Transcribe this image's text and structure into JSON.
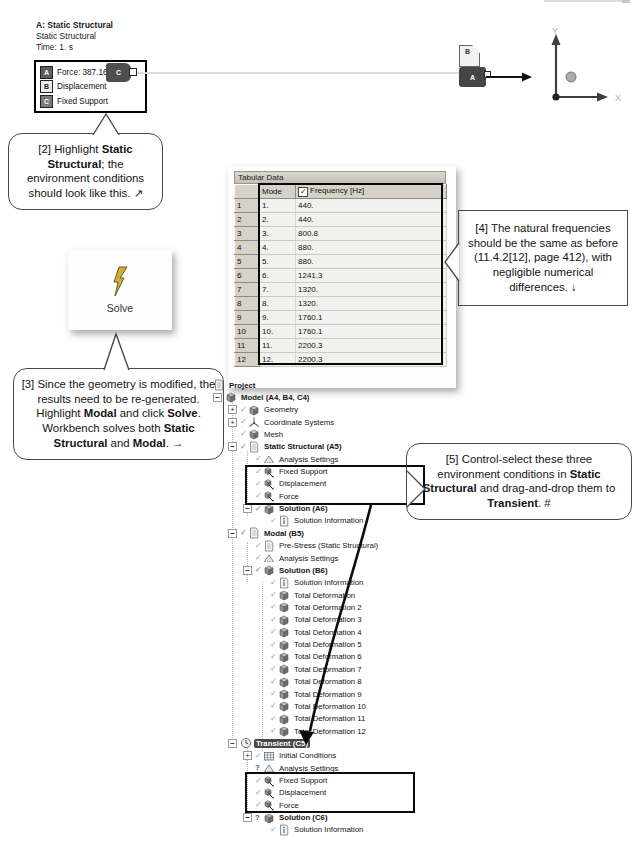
{
  "annotation_legend": {
    "title": "A: Static Structural",
    "line2": "Static Structural",
    "line3": "Time: 1. s",
    "items": [
      {
        "tag": "A",
        "label": "Force: 387.16 N",
        "chip_color": "#5c5c5c",
        "chip_text_color": "#ffffff"
      },
      {
        "tag": "B",
        "label": "Displacement",
        "chip_color": "#ececec",
        "chip_text_color": "#222222"
      },
      {
        "tag": "C",
        "label": "Fixed Support",
        "chip_color": "#7a7a7a",
        "chip_text_color": "#ffffff"
      }
    ]
  },
  "model_view": {
    "tags": {
      "left_support": "C",
      "top_right": "B",
      "bottom_right": "A"
    },
    "triad": {
      "x_label": "X",
      "y_label": "Y"
    }
  },
  "callouts": {
    "c2": {
      "segments": [
        [
          "n",
          "[2] Highlight "
        ],
        [
          "b",
          "Static Structural"
        ],
        [
          "n",
          "; the environment conditions should look like this. ↗"
        ]
      ]
    },
    "c3": {
      "segments": [
        [
          "n",
          "[3] Since the geometry is modified, the results need to be re-generated.  Highlight "
        ],
        [
          "b",
          "Modal"
        ],
        [
          "n",
          " and click "
        ],
        [
          "b",
          "Solve"
        ],
        [
          "n",
          ".  Workbench solves both "
        ],
        [
          "b",
          "Static Structural"
        ],
        [
          "n",
          " and "
        ],
        [
          "b",
          "Modal"
        ],
        [
          "n",
          ". →"
        ]
      ]
    },
    "c4": {
      "segments": [
        [
          "n",
          "[4] The natural frequencies should be the same as before (11.4.2[12], page 412), with negligible numerical differences. ↓"
        ]
      ]
    },
    "c5": {
      "segments": [
        [
          "n",
          "[5] Control-select these three environment conditions in "
        ],
        [
          "b",
          "Static Structural"
        ],
        [
          "n",
          " and drag-and-drop them to "
        ],
        [
          "b",
          "Transient"
        ],
        [
          "n",
          ". #"
        ]
      ]
    }
  },
  "solve_button": {
    "label": "Solve",
    "bolt_color": "#cfae3a"
  },
  "tabular_data": {
    "title": "Tabular Data",
    "columns": [
      "Mode",
      "Frequency [Hz]"
    ],
    "frequency_checkbox_checked": true,
    "rows": [
      {
        "n": "1",
        "mode": "1.",
        "freq": "440."
      },
      {
        "n": "2",
        "mode": "2.",
        "freq": "440."
      },
      {
        "n": "3",
        "mode": "3.",
        "freq": "800.8"
      },
      {
        "n": "4",
        "mode": "4.",
        "freq": "880."
      },
      {
        "n": "5",
        "mode": "5.",
        "freq": "880."
      },
      {
        "n": "6",
        "mode": "6.",
        "freq": "1241.3"
      },
      {
        "n": "7",
        "mode": "7.",
        "freq": "1320."
      },
      {
        "n": "8",
        "mode": "8.",
        "freq": "1320."
      },
      {
        "n": "9",
        "mode": "9.",
        "freq": "1760.1"
      },
      {
        "n": "10",
        "mode": "10.",
        "freq": "1760.1"
      },
      {
        "n": "11",
        "mode": "11.",
        "freq": "2200.3"
      },
      {
        "n": "12",
        "mode": "12.",
        "freq": "2200.3"
      }
    ]
  },
  "tree": {
    "items": [
      {
        "label": "Project",
        "icon": "project",
        "level": 0,
        "root": true,
        "bold": true
      },
      {
        "label": "Model (A4, B4, C4)",
        "icon": "model",
        "level": 0,
        "exp": "minus",
        "bold": true
      },
      {
        "label": "Geometry",
        "icon": "geometry",
        "level": 1,
        "exp": "plus",
        "status": "check"
      },
      {
        "label": "Coordinate Systems",
        "icon": "coordinate-systems",
        "level": 1,
        "exp": "plus",
        "status": "check"
      },
      {
        "label": "Mesh",
        "icon": "mesh",
        "level": 1,
        "status": "check"
      },
      {
        "label": "Static Structural (A5)",
        "icon": "static-structural",
        "level": 1,
        "exp": "minus",
        "status": "check",
        "bold": true
      },
      {
        "label": "Analysis Settings",
        "icon": "analysis-settings",
        "level": 2,
        "status": "check"
      },
      {
        "label": "Fixed Support",
        "icon": "fixed-support",
        "level": 2,
        "status": "check",
        "box": 1
      },
      {
        "label": "Displacement",
        "icon": "displacement",
        "level": 2,
        "status": "check",
        "box": 1
      },
      {
        "label": "Force",
        "icon": "force",
        "level": 2,
        "status": "check",
        "box": 1
      },
      {
        "label": "Solution (A6)",
        "icon": "solution",
        "level": 2,
        "exp": "minus",
        "status": "check",
        "bold": true
      },
      {
        "label": "Solution Information",
        "icon": "solution-information",
        "level": 3,
        "status": "check"
      },
      {
        "label": "Modal (B5)",
        "icon": "modal",
        "level": 1,
        "exp": "minus",
        "status": "check",
        "bold": true
      },
      {
        "label": "Pre-Stress (Static Structural)",
        "icon": "pre-stress",
        "level": 2,
        "status": "check"
      },
      {
        "label": "Analysis Settings",
        "icon": "analysis-settings",
        "level": 2,
        "status": "check"
      },
      {
        "label": "Solution (B6)",
        "icon": "solution",
        "level": 2,
        "exp": "minus",
        "status": "check",
        "bold": true
      },
      {
        "label": "Solution Information",
        "icon": "solution-information",
        "level": 3,
        "status": "check"
      },
      {
        "label": "Total Deformation",
        "icon": "total-deformation",
        "level": 3,
        "status": "check"
      },
      {
        "label": "Total Deformation 2",
        "icon": "total-deformation",
        "level": 3,
        "status": "check"
      },
      {
        "label": "Total Deformation 3",
        "icon": "total-deformation",
        "level": 3,
        "status": "check"
      },
      {
        "label": "Total Deformation 4",
        "icon": "total-deformation",
        "level": 3,
        "status": "check"
      },
      {
        "label": "Total Deformation 5",
        "icon": "total-deformation",
        "level": 3,
        "status": "check"
      },
      {
        "label": "Total Deformation 6",
        "icon": "total-deformation",
        "level": 3,
        "status": "check"
      },
      {
        "label": "Total Deformation 7",
        "icon": "total-deformation",
        "level": 3,
        "status": "check"
      },
      {
        "label": "Total Deformation 8",
        "icon": "total-deformation",
        "level": 3,
        "status": "check"
      },
      {
        "label": "Total Deformation 9",
        "icon": "total-deformation",
        "level": 3,
        "status": "check"
      },
      {
        "label": "Total Deformation 10",
        "icon": "total-deformation",
        "level": 3,
        "status": "check"
      },
      {
        "label": "Total Deformation 11",
        "icon": "total-deformation",
        "level": 3,
        "status": "check"
      },
      {
        "label": "Total Deformation 12",
        "icon": "total-deformation",
        "level": 3,
        "status": "check"
      },
      {
        "label": "Transient (C5)",
        "icon": "transient",
        "level": 1,
        "exp": "minus",
        "selected": true,
        "bold": true
      },
      {
        "label": "Initial Conditions",
        "icon": "initial-conditions",
        "level": 2,
        "exp": "plus",
        "status": "check"
      },
      {
        "label": "Analysis Settings",
        "icon": "analysis-settings",
        "level": 2,
        "status": "question"
      },
      {
        "label": "Fixed Support",
        "icon": "fixed-support",
        "level": 2,
        "status": "check",
        "box": 2
      },
      {
        "label": "Displacement",
        "icon": "displacement",
        "level": 2,
        "status": "check",
        "box": 2
      },
      {
        "label": "Force",
        "icon": "force",
        "level": 2,
        "status": "check",
        "box": 2
      },
      {
        "label": "Solution (C6)",
        "icon": "solution",
        "level": 2,
        "exp": "minus",
        "status": "question",
        "bold": true
      },
      {
        "label": "Solution Information",
        "icon": "solution-information",
        "level": 3,
        "status": "check"
      }
    ]
  },
  "colors": {
    "highlight_box": "#0a0a0a",
    "tree_selection_bg": "#474747",
    "check_mark": "#8fa28f",
    "callout_border": "#4a4a4a"
  }
}
